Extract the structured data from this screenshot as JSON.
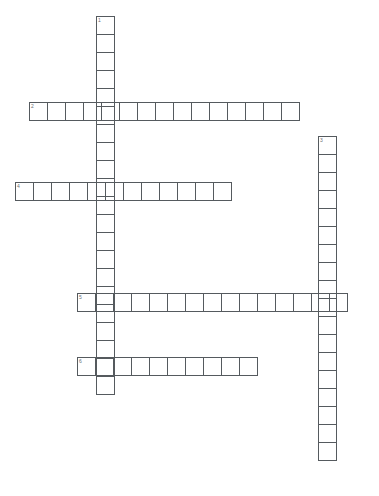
{
  "page": {
    "background_color": "#ffffff",
    "grid_line_color": "#555a5e",
    "number_color": "#6a6f73",
    "cell_size": 19
  },
  "grid": {
    "columns": 20,
    "rows": 26,
    "origin_x": 15,
    "origin_y": 16
  },
  "entries": [
    {
      "number": "1",
      "direction": "down",
      "length": 21,
      "x": 96,
      "y": 16,
      "cells": [
        "",
        "",
        "",
        "",
        "",
        "",
        "",
        "",
        "",
        "",
        "",
        "",
        "",
        "",
        "",
        "",
        "",
        "",
        "",
        "",
        ""
      ]
    },
    {
      "number": "2",
      "direction": "across",
      "length": 15,
      "x": 29,
      "y": 102,
      "cells": [
        "",
        "",
        "",
        "",
        "",
        "",
        "",
        "",
        "",
        "",
        "",
        "",
        "",
        "",
        ""
      ]
    },
    {
      "number": "3",
      "direction": "down",
      "length": 18,
      "x": 318,
      "y": 136,
      "cells": [
        "",
        "",
        "",
        "",
        "",
        "",
        "",
        "",
        "",
        "",
        "",
        "",
        "",
        "",
        "",
        "",
        "",
        ""
      ]
    },
    {
      "number": "4",
      "direction": "across",
      "length": 12,
      "x": 15,
      "y": 182,
      "cells": [
        "",
        "",
        "",
        "",
        "",
        "",
        "",
        "",
        "",
        "",
        "",
        ""
      ]
    },
    {
      "number": "5",
      "direction": "across",
      "length": 15,
      "x": 77,
      "y": 293,
      "cells": [
        "",
        "",
        "",
        "",
        "",
        "",
        "",
        "",
        "",
        "",
        "",
        "",
        "",
        "",
        ""
      ]
    },
    {
      "number": "6",
      "direction": "across",
      "length": 10,
      "x": 77,
      "y": 357,
      "cells": [
        "",
        "",
        "",
        "",
        "",
        "",
        "",
        "",
        "",
        ""
      ]
    }
  ]
}
